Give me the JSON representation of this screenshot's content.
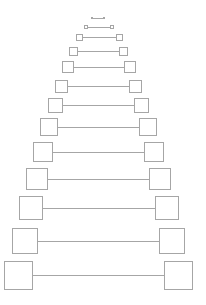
{
  "diagram": {
    "type": "dumbbell-pyramid",
    "stroke_color": "#a6a6a6",
    "background": "#ffffff",
    "rows": [
      {
        "y": 18,
        "size": 2,
        "left_x": 91,
        "right_x": 103
      },
      {
        "y": 27,
        "size": 4,
        "left_x": 84,
        "right_x": 110
      },
      {
        "y": 37,
        "size": 7,
        "left_x": 76,
        "right_x": 116
      },
      {
        "y": 51,
        "size": 9,
        "left_x": 69,
        "right_x": 119
      },
      {
        "y": 67,
        "size": 12,
        "left_x": 62,
        "right_x": 124
      },
      {
        "y": 105,
        "size": 15,
        "left_x": 48,
        "right_x": 134
      },
      {
        "y": 86,
        "size": 13,
        "left_x": 55,
        "right_x": 129
      },
      {
        "y": 127,
        "size": 18,
        "left_x": 40,
        "right_x": 139
      },
      {
        "y": 152,
        "size": 20,
        "left_x": 33,
        "right_x": 144
      },
      {
        "y": 179,
        "size": 22,
        "left_x": 26,
        "right_x": 149
      },
      {
        "y": 208,
        "size": 24,
        "left_x": 19,
        "right_x": 155
      },
      {
        "y": 241,
        "size": 26,
        "left_x": 12,
        "right_x": 159
      },
      {
        "y": 275,
        "size": 29,
        "left_x": 4,
        "right_x": 164
      }
    ]
  }
}
